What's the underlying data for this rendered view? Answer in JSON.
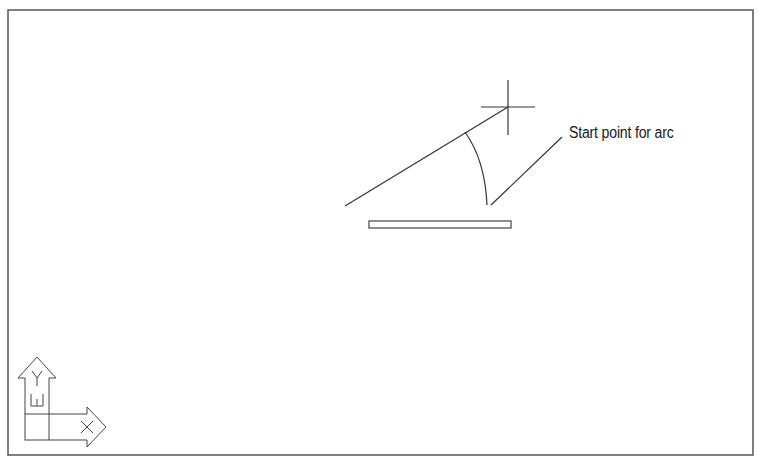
{
  "drawing": {
    "annotation": "Start point for arc",
    "ucs_icon": {
      "y_label": "Y",
      "w_label": "W",
      "x_label": "X"
    },
    "colors": {
      "background": "#ffffff",
      "line": "#333333",
      "frame": "#555555"
    }
  }
}
